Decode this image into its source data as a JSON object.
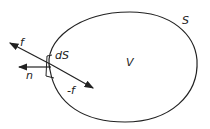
{
  "diagram": {
    "title": "",
    "labels": {
      "surface": "S",
      "volume": "V",
      "surface_element": "dS",
      "force": "f",
      "negative_force": "-f",
      "normal": "n"
    },
    "stroke_color": "#222222",
    "background": "#ffffff"
  }
}
